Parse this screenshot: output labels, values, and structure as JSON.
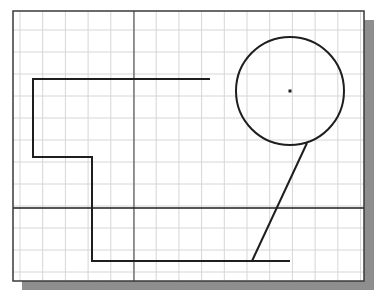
{
  "canvas": {
    "width": 376,
    "height": 297,
    "background": "#ffffff"
  },
  "viewport": {
    "frame": {
      "x": 13,
      "y": 11,
      "width": 351,
      "height": 270
    },
    "frame_color": "#3a3a3a",
    "shadow": {
      "offset": 9,
      "color": "#8e8e8e"
    },
    "grid": {
      "origin_x": 20,
      "origin_y": 8,
      "spacing_x": 22.7,
      "spacing_y": 22,
      "color": "#d6d6d6"
    }
  },
  "axes": {
    "vertical_x": 134,
    "horizontal_y": 208,
    "vertical_color": "#555555",
    "horizontal_color": "#1e1e1e"
  },
  "entities": {
    "polyline": {
      "points": [
        [
          210,
          79
        ],
        [
          33,
          79
        ],
        [
          33,
          157
        ],
        [
          92,
          157
        ],
        [
          92,
          261
        ],
        [
          290,
          261
        ]
      ],
      "color": "#1e1e1e",
      "width": 2
    },
    "circle": {
      "cx": 290,
      "cy": 91,
      "r": 54,
      "color": "#1e1e1e",
      "width": 2,
      "center_marker": true
    },
    "slanted_line": {
      "x1": 307,
      "y1": 143,
      "x2": 252,
      "y2": 261,
      "color": "#1e1e1e",
      "width": 2
    }
  }
}
